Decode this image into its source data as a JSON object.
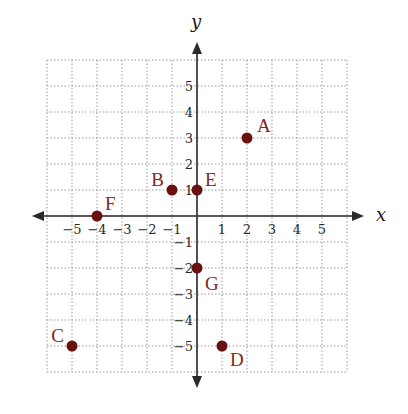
{
  "chart_data": {
    "type": "scatter",
    "title": "",
    "xlabel": "x",
    "ylabel": "y",
    "xlim": [
      -6,
      6
    ],
    "ylim": [
      -6,
      6
    ],
    "grid": true,
    "grid_style": "dotted",
    "x_ticks": [
      "−5",
      "−4",
      "−3",
      "−2",
      "−1",
      "1",
      "2",
      "3",
      "4",
      "5"
    ],
    "y_ticks": [
      "5",
      "4",
      "3",
      "2",
      "1",
      "−1",
      "−2",
      "−3",
      "−4",
      "−5"
    ],
    "points": [
      {
        "label": "A",
        "x": 2,
        "y": 3
      },
      {
        "label": "B",
        "x": -1,
        "y": 1
      },
      {
        "label": "C",
        "x": -5,
        "y": -5
      },
      {
        "label": "D",
        "x": 1,
        "y": -5
      },
      {
        "label": "E",
        "x": 0,
        "y": 1
      },
      {
        "label": "F",
        "x": -4,
        "y": 0
      },
      {
        "label": "G",
        "x": 0,
        "y": -2
      }
    ],
    "point_color": "#6b1010",
    "label_color": "#7a2a1e"
  }
}
